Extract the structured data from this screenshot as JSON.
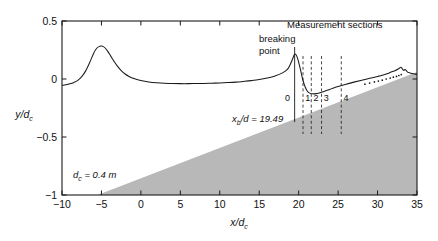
{
  "chart_data": {
    "type": "line",
    "title": "",
    "xlabel": "x/dc",
    "ylabel": "y/dc",
    "xlim": [
      -10,
      35
    ],
    "ylim": [
      -1,
      0.5
    ],
    "xticks": [
      -10,
      -5,
      0,
      5,
      10,
      15,
      20,
      25,
      30,
      35
    ],
    "xticklabels": [
      "−10",
      "−5",
      "0",
      "5",
      "10",
      "15",
      "20",
      "25",
      "30",
      "35"
    ],
    "yticks": [
      -1,
      -0.5,
      0,
      0.5
    ],
    "yticklabels": [
      "−1",
      "−0.5",
      "0",
      "0.5"
    ],
    "grid": false,
    "legend": "none",
    "series": [
      {
        "name": "free surface",
        "style": "solid-line",
        "comment": "water surface elevation along the flume: undular hump upstream, shoaling rise to breaking point, plunge, roller recovery",
        "x": [
          -10,
          -9.5,
          -9,
          -8.5,
          -8,
          -7.5,
          -7,
          -6.5,
          -6,
          -5.6,
          -5.2,
          -5.0,
          -4.8,
          -4.5,
          -4.2,
          -3.8,
          -3.4,
          -3.0,
          -2.5,
          -2.0,
          -1.5,
          -1.0,
          -0.5,
          0,
          1,
          2,
          3,
          4,
          5,
          6,
          7,
          8,
          9,
          10,
          11,
          12,
          13,
          14,
          15,
          16,
          17,
          18,
          18.6,
          19.0,
          19.3,
          19.49,
          19.7,
          19.9,
          20.2,
          20.5,
          20.8,
          21.1,
          21.4,
          21.8,
          22.2,
          22.6,
          23.0,
          23.5,
          24.0,
          24.5,
          25.0,
          26.0,
          27.0,
          28.0,
          29.0,
          30.0,
          30.6,
          31.0,
          31.4,
          31.8,
          32.2,
          32.5,
          32.8,
          33.0,
          33.3,
          33.5,
          33.8,
          34.0,
          34.2,
          34.5,
          34.8,
          35.0
        ],
        "y": [
          -0.055,
          -0.05,
          -0.042,
          -0.03,
          -0.012,
          0.02,
          0.07,
          0.14,
          0.22,
          0.265,
          0.283,
          0.285,
          0.281,
          0.265,
          0.238,
          0.195,
          0.152,
          0.113,
          0.073,
          0.043,
          0.022,
          0.006,
          -0.005,
          -0.013,
          -0.026,
          -0.033,
          -0.037,
          -0.039,
          -0.04,
          -0.04,
          -0.039,
          -0.038,
          -0.036,
          -0.034,
          -0.031,
          -0.027,
          -0.021,
          -0.014,
          -0.005,
          0.008,
          0.026,
          0.055,
          0.085,
          0.135,
          0.185,
          0.215,
          0.205,
          0.17,
          0.09,
          0.0,
          -0.065,
          -0.105,
          -0.122,
          -0.128,
          -0.126,
          -0.12,
          -0.112,
          -0.1,
          -0.088,
          -0.076,
          -0.065,
          -0.045,
          -0.027,
          -0.01,
          0.006,
          0.022,
          0.032,
          0.04,
          0.05,
          0.062,
          0.072,
          0.082,
          0.095,
          0.1,
          0.075,
          0.082,
          0.06,
          0.055,
          0.05,
          0.045,
          0.042,
          0.04
        ]
      },
      {
        "name": "aerated/roller dots",
        "style": "dotted-markers",
        "x": [
          28.4,
          29.0,
          29.6,
          30.1,
          30.6,
          31.1,
          31.6,
          32.0,
          32.4,
          32.7,
          33.0
        ],
        "y": [
          -0.045,
          -0.035,
          -0.025,
          -0.018,
          -0.01,
          0.0,
          0.008,
          0.016,
          0.022,
          0.03,
          0.038
        ]
      },
      {
        "name": "bed slope",
        "style": "filled-gray",
        "comment": "sloping bed, shaded gray; rises from y=-1 near x=-5.5 to top-right corner",
        "x": [
          -5.5,
          35
        ],
        "y": [
          -1.0,
          0.06
        ]
      }
    ],
    "annotations": {
      "measurement_sections_title": "Measurement sections",
      "breaking_point_label_line1": "breaking",
      "breaking_point_label_line2": "point",
      "breaking_point_x": 19.49,
      "xb_label_main": "/d = 19.49",
      "xb_label_var": "x",
      "xb_label_sub": "b",
      "depth_label_var": "d",
      "depth_label_sub": "c",
      "depth_label_value": " = 0.4 m",
      "section_lines": [
        {
          "label": "0",
          "x": 19.49,
          "style": "solid"
        },
        {
          "label": "1",
          "x": 20.55,
          "style": "dashed"
        },
        {
          "label": "2",
          "x": 21.6,
          "style": "dashed"
        },
        {
          "label": "3",
          "x": 22.9,
          "style": "dashed"
        },
        {
          "label": "4",
          "x": 25.4,
          "style": "dashed"
        }
      ]
    },
    "colors": {
      "line": "#1a1a1a",
      "bed_fill": "#b8b8b8",
      "axis": "#1a1a1a",
      "text": "#111111"
    }
  }
}
